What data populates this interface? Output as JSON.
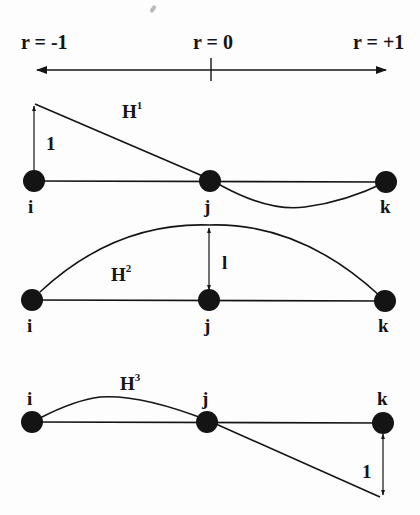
{
  "axis": {
    "left_label": "r = -1",
    "center_label": "r = 0",
    "right_label": "r = +1"
  },
  "diagrams": [
    {
      "name": "H",
      "superscript": "1",
      "unit_label": "1",
      "nodes": [
        "i",
        "j",
        "k"
      ]
    },
    {
      "name": "H",
      "superscript": "2",
      "unit_label": "l",
      "nodes": [
        "i",
        "j",
        "k"
      ]
    },
    {
      "name": "H",
      "superscript": "3",
      "unit_label": "1",
      "nodes": [
        "i",
        "j",
        "k"
      ]
    }
  ],
  "colors": {
    "ink": "#141414",
    "background": "#fdfdfd"
  }
}
